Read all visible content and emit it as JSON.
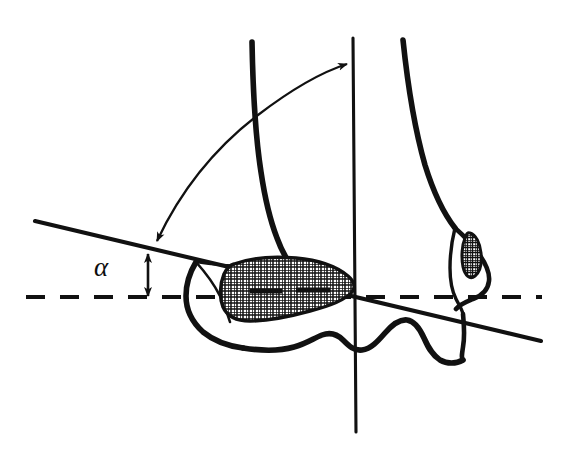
{
  "figure": {
    "name": "ankle-joint-angle-diagram",
    "background_color": "#ffffff",
    "ink_color": "#111111",
    "width": 567,
    "height": 450
  },
  "labels": {
    "angle_symbol": "α"
  },
  "annotations": {
    "angle_symbol_position": {
      "x": 101,
      "y": 273
    },
    "angle_measured_between": "horizontal dashed reference line and oblique joint line",
    "arc_arrow_measures": "angle between oblique line and vertical tibial axis",
    "arc_arrow_style": "double-headed curved arrow"
  },
  "geometry": {
    "vertical_axis": {
      "x1": 353,
      "y1": 38,
      "x2": 356,
      "y2": 432
    },
    "oblique_line": {
      "x1": 35,
      "y1": 221,
      "x2": 541,
      "y2": 341
    },
    "dashed_line": {
      "x1": 26,
      "y1": 297,
      "x2": 542,
      "y2": 297,
      "dash": "18 14"
    },
    "vertical_double_arrow": {
      "x": 148,
      "y_top": 252,
      "y_bottom": 297
    },
    "arc_arrow": {
      "start_x": 155,
      "start_y": 243,
      "end_x": 349,
      "end_y": 63
    }
  },
  "regions": [
    {
      "name": "medial-epiphysis-hatched-region",
      "fill": "cross-hatch",
      "description": "large kidney-shaped cross-hatched area in distal tibial epiphysis"
    },
    {
      "name": "lateral-malleolus-hatched-region",
      "fill": "cross-hatch",
      "description": "small elongated cross-hatched oval within lateral malleolus"
    }
  ],
  "outlines": [
    {
      "name": "tibial-medial-cortex",
      "description": "thick curve descending from upper left"
    },
    {
      "name": "fibular-lateral-cortex",
      "description": "thick curve descending from upper right"
    },
    {
      "name": "tibial-plafond-contour",
      "description": "wavy bottom articular contour"
    },
    {
      "name": "medial-malleolus-notch",
      "description": "thin triangular notch on medial side"
    },
    {
      "name": "lateral-malleolus-outline",
      "description": "elongated outline on lateral side"
    }
  ]
}
